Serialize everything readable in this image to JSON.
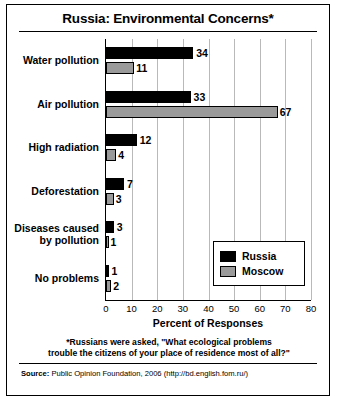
{
  "chart_data": {
    "type": "bar",
    "title": "Russia: Environmental Concerns*",
    "xlabel": "Percent of Responses",
    "ylabel": "",
    "orientation": "horizontal",
    "categories": [
      "Water pollution",
      "Air pollution",
      "High radiation",
      "Deforestation",
      "Diseases caused\nby pollution",
      "No problems"
    ],
    "category_lines": [
      [
        "Water pollution"
      ],
      [
        "Air pollution"
      ],
      [
        "High radiation"
      ],
      [
        "Deforestation"
      ],
      [
        "Diseases caused",
        "by pollution"
      ],
      [
        "No problems"
      ]
    ],
    "series": [
      {
        "name": "Russia",
        "color": "#000000",
        "values": [
          34,
          33,
          12,
          7,
          3,
          1
        ]
      },
      {
        "name": "Moscow",
        "color": "#9a9a9a",
        "values": [
          11,
          67,
          4,
          3,
          1,
          2
        ]
      }
    ],
    "xlim": [
      0,
      80
    ],
    "xticks": [
      0,
      10,
      20,
      30,
      40,
      50,
      60,
      70,
      80
    ],
    "grid": true,
    "legend_position": "inside-right-lower"
  },
  "footnote": "*Russians were asked, \"What ecological problems trouble the citizens of your place of residence most of all?\"",
  "footnote_lines": [
    "*Russians were asked, \"What ecological problems",
    "trouble the citizens of your place of residence most of all?\""
  ],
  "source": {
    "label": "Source:",
    "text": "Public Opinion Foundation, 2006 (http://bd.english.fom.ru/)"
  }
}
